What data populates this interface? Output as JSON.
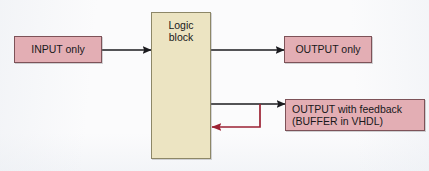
{
  "diagram": {
    "background_color": "#fbfbfc",
    "blocks": {
      "input": {
        "label": "INPUT only",
        "fill": "#e3aeb4",
        "stroke": "#7d5258"
      },
      "logic": {
        "label_line1": "Logic",
        "label_line2": "block",
        "fill": "#ece4c2",
        "stroke": "#8d8767"
      },
      "output": {
        "label": "OUTPUT only",
        "fill": "#e3aeb4",
        "stroke": "#7d5258"
      },
      "feedback": {
        "label_line1": "OUTPUT with feedback",
        "label_line2": "(BUFFER in VHDL)",
        "fill": "#e3aeb4",
        "stroke": "#7d5258"
      }
    },
    "connectors": {
      "input_arrow": {
        "name": "input-to-logic-arrow",
        "color": "#1b1b1f"
      },
      "output_arrow": {
        "name": "logic-to-output-arrow",
        "color": "#1b1b1f"
      },
      "feedback_out_arrow": {
        "name": "logic-to-feedback-arrow",
        "color": "#1b1b1f"
      },
      "feedback_return_arrow": {
        "name": "feedback-return-arrow",
        "color": "#9c2233"
      }
    }
  }
}
